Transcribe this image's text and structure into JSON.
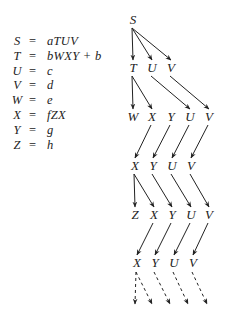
{
  "grammar": {
    "rules": [
      {
        "lhs": "S",
        "rhs": "aTUV"
      },
      {
        "lhs": "T",
        "rhs": "bWXY + b"
      },
      {
        "lhs": "U",
        "rhs": "c"
      },
      {
        "lhs": "V",
        "rhs": "d"
      },
      {
        "lhs": "W",
        "rhs": "e"
      },
      {
        "lhs": "X",
        "rhs": "fZX"
      },
      {
        "lhs": "Y",
        "rhs": "g"
      },
      {
        "lhs": "Z",
        "rhs": "h"
      }
    ],
    "equals": "="
  },
  "derivation_tree": {
    "rows": [
      [
        "S"
      ],
      [
        "T",
        "U",
        "V"
      ],
      [
        "W",
        "X",
        "Y",
        "U",
        "V"
      ],
      [
        "X",
        "Y",
        "U",
        "V"
      ],
      [
        "Z",
        "X",
        "Y",
        "U",
        "V"
      ],
      [
        "X",
        "Y",
        "U",
        "V"
      ]
    ],
    "edges": [
      {
        "row": 0,
        "from": 0,
        "to": 0
      },
      {
        "row": 0,
        "from": 0,
        "to": 1
      },
      {
        "row": 0,
        "from": 0,
        "to": 2
      },
      {
        "row": 1,
        "from": 0,
        "to": 0
      },
      {
        "row": 1,
        "from": 0,
        "to": 1
      },
      {
        "row": 1,
        "from": 1,
        "to": 3
      },
      {
        "row": 1,
        "from": 2,
        "to": 4
      },
      {
        "row": 2,
        "from": 1,
        "to": 0
      },
      {
        "row": 2,
        "from": 2,
        "to": 1
      },
      {
        "row": 2,
        "from": 3,
        "to": 2
      },
      {
        "row": 2,
        "from": 4,
        "to": 3
      },
      {
        "row": 3,
        "from": 0,
        "to": 0
      },
      {
        "row": 3,
        "from": 0,
        "to": 1
      },
      {
        "row": 3,
        "from": 1,
        "to": 2
      },
      {
        "row": 3,
        "from": 2,
        "to": 3
      },
      {
        "row": 3,
        "from": 3,
        "to": 4
      },
      {
        "row": 4,
        "from": 1,
        "to": 0
      },
      {
        "row": 4,
        "from": 2,
        "to": 1
      },
      {
        "row": 4,
        "from": 3,
        "to": 2
      },
      {
        "row": 4,
        "from": 4,
        "to": 3
      }
    ],
    "continuation_edges": [
      {
        "from": 0,
        "to": 0
      },
      {
        "from": 0,
        "to": 1
      },
      {
        "from": 1,
        "to": 2
      },
      {
        "from": 2,
        "to": 3
      },
      {
        "from": 3,
        "to": 4
      }
    ]
  }
}
